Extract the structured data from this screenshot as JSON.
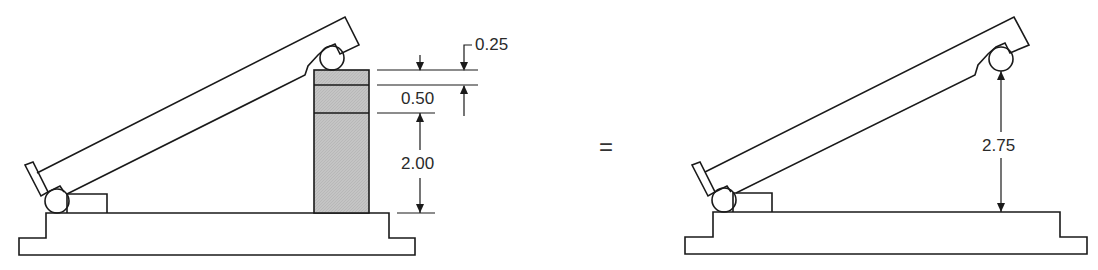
{
  "figure": {
    "left": {
      "description": "Sine bar resting on stacked gauge blocks",
      "dimensions": {
        "top_block": "0.25",
        "middle_block": "0.50",
        "bottom_block": "2.00"
      }
    },
    "operator": "=",
    "right": {
      "description": "Equivalent sine bar with total height",
      "dimensions": {
        "total_height": "2.75"
      }
    }
  },
  "colors": {
    "line": "#1a1a1a",
    "block_fill": "#c8c8c8",
    "background": "#ffffff"
  }
}
